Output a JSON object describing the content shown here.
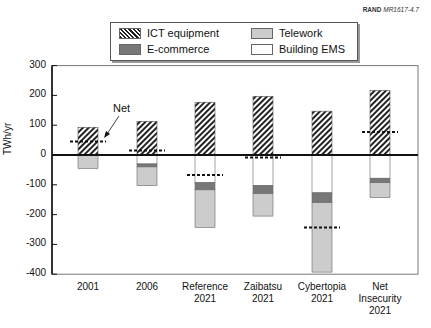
{
  "credit": {
    "org": "RAND",
    "id": "MR1617-4.7"
  },
  "legend": {
    "ict": "ICT equipment",
    "telework": "Telework",
    "ecommerce": "E-commerce",
    "ems": "Building EMS"
  },
  "annotation": "Net",
  "chart_data": {
    "type": "bar",
    "title": "",
    "xlabel": "",
    "ylabel": "TWh/yr",
    "ylim": [
      -400,
      300
    ],
    "yticks": [
      300,
      200,
      100,
      0,
      -100,
      -200,
      -300,
      -400
    ],
    "grid": false,
    "legend_position": "top",
    "categories": [
      "2001",
      "2006",
      "Reference 2021",
      "Zaibatsu 2021",
      "Cybertopia 2021",
      "Net Insecurity 2021"
    ],
    "category_labels": [
      [
        "2001"
      ],
      [
        "2006"
      ],
      [
        "Reference",
        "2021"
      ],
      [
        "Zaibatsu",
        "2021"
      ],
      [
        "Cybertopia",
        "2021"
      ],
      [
        "Net",
        "Insecurity",
        "2021"
      ]
    ],
    "series": [
      {
        "name": "ICT equipment",
        "pattern": "hatched",
        "values": [
          93,
          113,
          177,
          197,
          147,
          217
        ]
      },
      {
        "name": "Building EMS",
        "color": "#ffffff",
        "values": [
          0,
          -30,
          -93,
          -103,
          -127,
          -78
        ]
      },
      {
        "name": "E-commerce",
        "color": "#777777",
        "values": [
          0,
          -10,
          -24,
          -27,
          -33,
          -15
        ]
      },
      {
        "name": "Telework",
        "color": "#cccccc",
        "values": [
          -45,
          -63,
          -126,
          -75,
          -233,
          -50
        ]
      }
    ],
    "net": {
      "name": "Net",
      "style": "dashed line",
      "values": [
        45,
        15,
        -67,
        -8,
        -243,
        77
      ]
    },
    "annotations": [
      {
        "text": "Net",
        "target": "2001 net line"
      }
    ]
  }
}
